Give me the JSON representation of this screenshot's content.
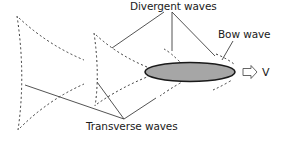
{
  "diagram": {
    "labels": {
      "divergent": "Divergent waves",
      "bow": "Bow wave",
      "transverse": "Transverse waves",
      "velocity": "V"
    },
    "colors": {
      "ship_fill": "#a6a6a6",
      "ship_stroke": "#1a1a1a",
      "line": "#404040",
      "dashed": "#333333",
      "arrow_fill": "#ffffff",
      "text": "#1a1a1a"
    },
    "elements": {
      "ship": "grey ellipse hull moving right",
      "direction_arrow": "hollow right arrow indicating velocity V",
      "wave_groups": 3
    }
  }
}
